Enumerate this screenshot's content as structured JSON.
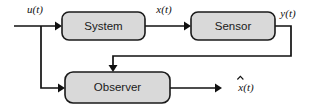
{
  "diagram": {
    "colors": {
      "block_fill": "#d9d9d9",
      "block_stroke": "#1a1a1a",
      "wire": "#111111",
      "background": "#ffffff",
      "text": "#1a1a1a"
    },
    "blocks": [
      {
        "id": "system",
        "label": "System"
      },
      {
        "id": "sensor",
        "label": "Sensor"
      },
      {
        "id": "observer",
        "label": "Observer"
      }
    ],
    "signals": [
      {
        "id": "u",
        "label": "u(t)",
        "base": "u",
        "arg": "(t)",
        "hat": false,
        "from": "input",
        "to": "system"
      },
      {
        "id": "x",
        "label": "x(t)",
        "base": "x",
        "arg": "(t)",
        "hat": false,
        "from": "system",
        "to": "sensor"
      },
      {
        "id": "y",
        "label": "y(t)",
        "base": "y",
        "arg": "(t)",
        "hat": false,
        "from": "sensor",
        "to": "observer"
      },
      {
        "id": "xhat",
        "label": "x̂(t)",
        "base": "x",
        "arg": "(t)",
        "hat": true,
        "from": "observer",
        "to": "output"
      }
    ]
  }
}
